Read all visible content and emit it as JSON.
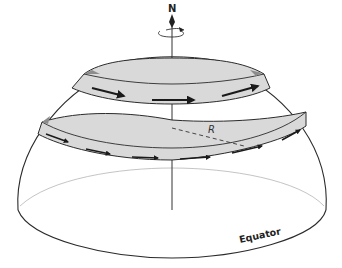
{
  "diagram": {
    "labels": {
      "north": "N",
      "radius": "R",
      "equator": "Equator"
    },
    "colors": {
      "outline": "#2b2b2b",
      "band_fill": "#d9d9d9",
      "band_rim": "#8c8c8c",
      "equator_back": "#b5b5b5",
      "arrow": "#1a1a1a"
    },
    "elements": {
      "rotation_axis": "vertical axis through pole with rotation arrow",
      "upper_band_arrows": 3,
      "lower_band_arrows": 7,
      "radius_line": "dashed"
    }
  }
}
